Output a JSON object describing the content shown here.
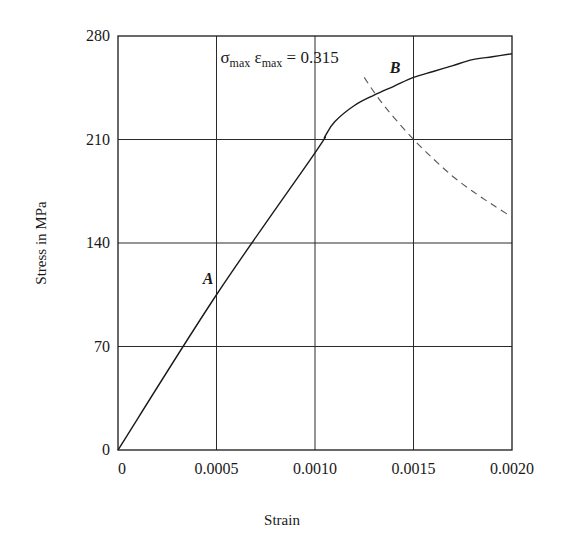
{
  "chart_data": {
    "type": "line",
    "title": "",
    "xlabel": "Strain",
    "ylabel": "Stress in MPa",
    "xlim": [
      0,
      0.002
    ],
    "ylim": [
      0,
      280
    ],
    "grid": true,
    "legend": null,
    "x_ticks": [
      0,
      0.0005,
      0.001,
      0.0015,
      0.002
    ],
    "x_tick_labels": [
      "0",
      "0.0005",
      "0.0010",
      "0.0015",
      "0.0020"
    ],
    "y_ticks": [
      0,
      70,
      140,
      210,
      280
    ],
    "y_tick_labels": [
      "0",
      "70",
      "140",
      "210",
      "280"
    ],
    "series": [
      {
        "name": "Stress-strain curve",
        "style": "solid",
        "x": [
          0,
          0.0005,
          0.001,
          0.00105,
          0.0011,
          0.0012,
          0.0013,
          0.0014,
          0.0015,
          0.0016,
          0.0017,
          0.0018,
          0.0019,
          0.002
        ],
        "y": [
          0,
          105,
          201,
          212,
          222,
          233,
          240,
          246,
          252,
          256,
          260,
          264,
          266,
          268
        ]
      },
      {
        "name": "Hyperbola sigma*epsilon = 0.315",
        "style": "dashed",
        "x": [
          0.00125,
          0.0013,
          0.00135,
          0.0014,
          0.0015,
          0.0016,
          0.0017,
          0.0018,
          0.0019,
          0.002
        ],
        "y": [
          252,
          242,
          233,
          225,
          210,
          197,
          185,
          175,
          166,
          157.5
        ]
      }
    ],
    "annotations": [
      {
        "text": "A",
        "x": 0.00043,
        "y": 112
      },
      {
        "text": "B",
        "x": 0.00138,
        "y": 255
      },
      {
        "text_main": "σ",
        "sub1": "max",
        "text_mid": " ε",
        "sub2": "max",
        "text_end": " = 0.315",
        "x": 0.00052,
        "y": 262
      }
    ]
  }
}
